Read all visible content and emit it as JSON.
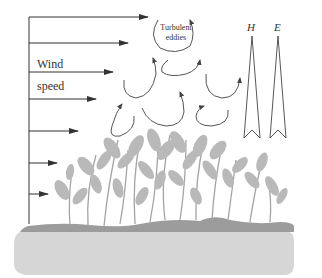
{
  "diagram": {
    "type": "canopy turbulence schematic",
    "labels": {
      "wind_line1": "Wind",
      "wind_line2": "speed",
      "eddies_line1": "Turbulent",
      "eddies_line2": "eddies",
      "flux_h": "H",
      "flux_e": "E"
    },
    "wind_profile": {
      "axis_x": 29,
      "axis_top": 17,
      "axis_bottom": 222,
      "arrows": [
        {
          "y": 17,
          "x_end": 148
        },
        {
          "y": 43,
          "x_end": 128
        },
        {
          "y": 72,
          "x_end": 113
        },
        {
          "y": 99,
          "x_end": 96
        },
        {
          "y": 131,
          "x_end": 78
        },
        {
          "y": 163,
          "x_end": 57
        },
        {
          "y": 194,
          "x_end": 48
        }
      ]
    },
    "colors": {
      "line": "#333333",
      "eddy": "#555555",
      "foliage": "#b8b8b8",
      "stem": "#a0a0a0",
      "ground_dark": "#9a9a9a",
      "soil": "#d4d4d4"
    }
  }
}
